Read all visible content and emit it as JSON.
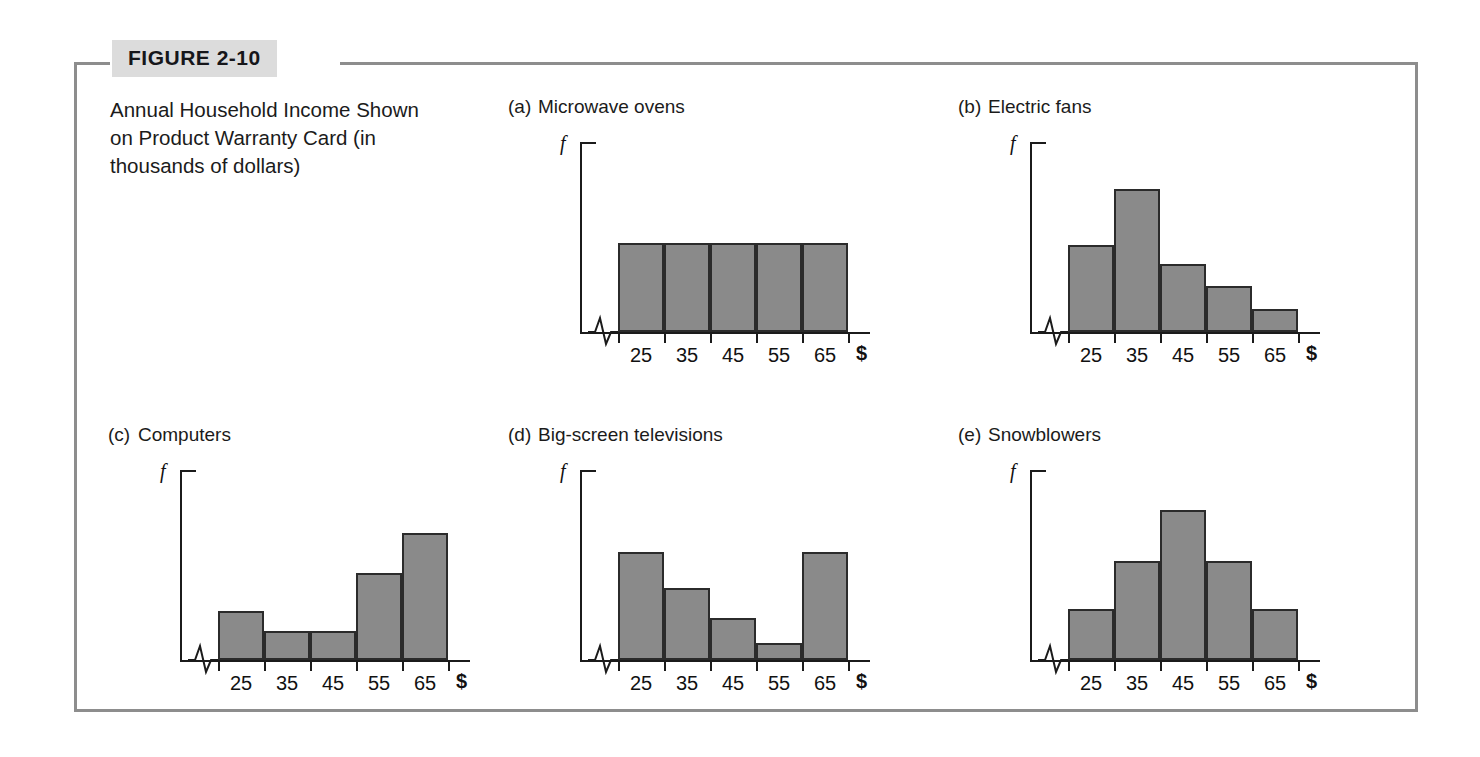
{
  "figure": {
    "tag": "FIGURE 2-10",
    "caption": "Annual Household Income Shown on Product Warranty Card (in thousands of dollars)"
  },
  "axis": {
    "y_label": "f",
    "x_currency_label": "$",
    "x_tick_labels": [
      "25",
      "35",
      "45",
      "55",
      "65"
    ]
  },
  "colors": {
    "bar_fill": "#8a8a8a",
    "bar_stroke": "#2b2b2b",
    "frame": "#8d8d8d",
    "tag_background": "#dcdcdc",
    "text": "#1b1b1b"
  },
  "chart_data": [
    {
      "type": "bar",
      "panel": "(a)",
      "title": "Microwave ovens",
      "shape": "uniform",
      "categories": [
        "25",
        "35",
        "45",
        "55",
        "65"
      ],
      "values": [
        47,
        47,
        47,
        47,
        47
      ],
      "xlabel": "$",
      "ylabel": "f",
      "ylim": [
        0,
        100
      ],
      "grid": false,
      "axis_break": true
    },
    {
      "type": "bar",
      "panel": "(b)",
      "title": "Electric fans",
      "shape": "skewed-right",
      "categories": [
        "25",
        "35",
        "45",
        "55",
        "65"
      ],
      "values": [
        46,
        75,
        36,
        24,
        12
      ],
      "xlabel": "$",
      "ylabel": "f",
      "ylim": [
        0,
        100
      ],
      "grid": false,
      "axis_break": true
    },
    {
      "type": "bar",
      "panel": "(c)",
      "title": "Computers",
      "shape": "skewed-left",
      "categories": [
        "25",
        "35",
        "45",
        "55",
        "65"
      ],
      "values": [
        26,
        15,
        15,
        46,
        67
      ],
      "xlabel": "$",
      "ylabel": "f",
      "ylim": [
        0,
        100
      ],
      "grid": false,
      "axis_break": true
    },
    {
      "type": "bar",
      "panel": "(d)",
      "title": "Big-screen televisions",
      "shape": "bimodal",
      "categories": [
        "25",
        "35",
        "45",
        "55",
        "65"
      ],
      "values": [
        57,
        38,
        22,
        9,
        57
      ],
      "xlabel": "$",
      "ylabel": "f",
      "ylim": [
        0,
        100
      ],
      "grid": false,
      "axis_break": true
    },
    {
      "type": "bar",
      "panel": "(e)",
      "title": "Snowblowers",
      "shape": "symmetric",
      "categories": [
        "25",
        "35",
        "45",
        "55",
        "65"
      ],
      "values": [
        27,
        52,
        79,
        52,
        27
      ],
      "xlabel": "$",
      "ylabel": "f",
      "ylim": [
        0,
        100
      ],
      "grid": false,
      "axis_break": true
    }
  ]
}
